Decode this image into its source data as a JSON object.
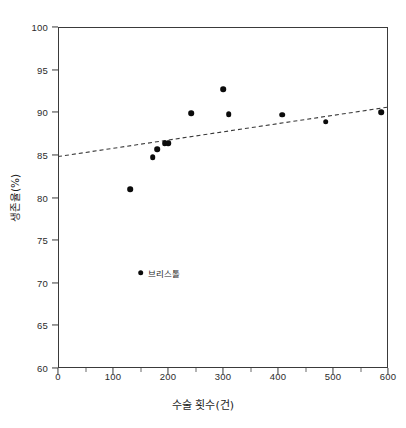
{
  "chart_data": {
    "type": "scatter",
    "title": "",
    "xlabel": "수술 횟수(건)",
    "ylabel": "생존율(%)",
    "xlim": [
      0,
      600
    ],
    "ylim": [
      60,
      100
    ],
    "xticks": [
      0,
      100,
      200,
      300,
      400,
      500,
      600
    ],
    "yticks": [
      60,
      65,
      70,
      75,
      80,
      85,
      90,
      95,
      100
    ],
    "grid": false,
    "legend": null,
    "marker_color": "#0b0b0b",
    "frame_color": "#3a3a3a",
    "points": [
      {
        "x": 131,
        "y": 81.0,
        "label": ""
      },
      {
        "x": 150,
        "y": 71.2,
        "label": "브리스톨"
      },
      {
        "x": 172,
        "y": 84.7,
        "label": ""
      },
      {
        "x": 180,
        "y": 85.7,
        "label": ""
      },
      {
        "x": 194,
        "y": 86.4,
        "label": ""
      },
      {
        "x": 200,
        "y": 86.4,
        "label": ""
      },
      {
        "x": 242,
        "y": 89.9,
        "label": ""
      },
      {
        "x": 300,
        "y": 92.7,
        "label": ""
      },
      {
        "x": 310,
        "y": 89.8,
        "label": ""
      },
      {
        "x": 408,
        "y": 89.7,
        "label": ""
      },
      {
        "x": 487,
        "y": 88.9,
        "label": ""
      },
      {
        "x": 588,
        "y": 90.0,
        "label": ""
      }
    ],
    "trendline": {
      "style": "dashed",
      "color": "#3a3a3a",
      "x_start": 0,
      "y_start": 84.8,
      "x_end": 600,
      "y_end": 90.6
    },
    "annotations": [
      {
        "text": "브리스톨",
        "x": 150,
        "y": 71.2
      }
    ]
  }
}
